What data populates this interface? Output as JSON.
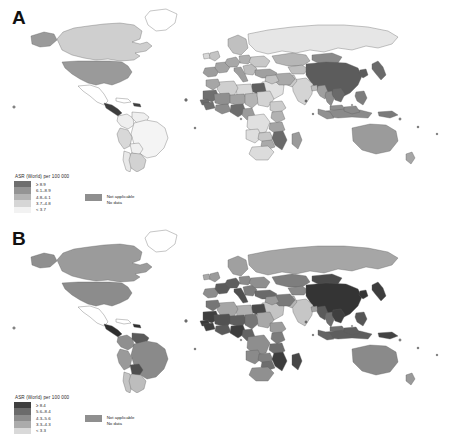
{
  "figure": {
    "type": "two-panel world choropleth map",
    "background": "#ffffff"
  },
  "panels": [
    {
      "letter": "A",
      "legend": {
        "title": "ASR (World) per 100 000",
        "classes": [
          {
            "label": "≥ 8.9",
            "color": "#6e6e6e"
          },
          {
            "label": "6.1–8.9",
            "color": "#949494"
          },
          {
            "label": "4.8–6.1",
            "color": "#b4b4b4"
          },
          {
            "label": "3.7–4.8",
            "color": "#d6d6d6"
          },
          {
            "label": "< 3.7",
            "color": "#f2f2f2"
          }
        ],
        "not_applicable": {
          "label": "Not applicable",
          "color": "#8f8f8f"
        },
        "no_data": {
          "label": "No data",
          "color": "#ffffff"
        }
      }
    },
    {
      "letter": "B",
      "legend": {
        "title": "ASR (World) per 100 000",
        "classes": [
          {
            "label": "≥ 8.4",
            "color": "#3f3f3f"
          },
          {
            "label": "5.6–8.4",
            "color": "#6b6b6b"
          },
          {
            "label": "4.3–5.6",
            "color": "#8d8d8d"
          },
          {
            "label": "3.3–4.3",
            "color": "#ababab"
          },
          {
            "label": "< 3.3",
            "color": "#d9d9d9"
          }
        ],
        "not_applicable": {
          "label": "Not applicable",
          "color": "#8f8f8f"
        },
        "no_data": {
          "label": "No data",
          "color": "#ffffff"
        }
      }
    }
  ],
  "chart_data": {
    "type": "heatmap",
    "title": "ASR (World) per 100 000",
    "subtitle": "",
    "xlabel": "",
    "ylabel": "",
    "legend_position": "bottom-left",
    "grid": false,
    "panels": [
      {
        "name": "A",
        "class_breaks": [
          "< 3.7",
          "3.7–4.8",
          "4.8–6.1",
          "6.1–8.9",
          "≥ 8.9"
        ],
        "regions": [
          {
            "name": "China",
            "class": 5
          },
          {
            "name": "Mongolia",
            "class": 5
          },
          {
            "name": "Japan",
            "class": 5
          },
          {
            "name": "North Korea",
            "class": 5
          },
          {
            "name": "South Korea",
            "class": 5
          },
          {
            "name": "Vietnam",
            "class": 5
          },
          {
            "name": "Laos",
            "class": 5
          },
          {
            "name": "Cambodia",
            "class": 5
          },
          {
            "name": "Thailand",
            "class": 4
          },
          {
            "name": "Myanmar",
            "class": 4
          },
          {
            "name": "Philippines",
            "class": 4
          },
          {
            "name": "Indonesia",
            "class": 4
          },
          {
            "name": "Malaysia",
            "class": 4
          },
          {
            "name": "Papua New Guinea",
            "class": 4
          },
          {
            "name": "India",
            "class": 3
          },
          {
            "name": "Pakistan",
            "class": 3
          },
          {
            "name": "Bangladesh",
            "class": 3
          },
          {
            "name": "Kazakhstan",
            "class": 4
          },
          {
            "name": "Russian Federation",
            "class": 2
          },
          {
            "name": "Iran",
            "class": 4
          },
          {
            "name": "Iraq",
            "class": 3
          },
          {
            "name": "Saudi Arabia",
            "class": 2
          },
          {
            "name": "Turkey",
            "class": 4
          },
          {
            "name": "Egypt",
            "class": 5
          },
          {
            "name": "Libya",
            "class": 3
          },
          {
            "name": "Algeria",
            "class": 3
          },
          {
            "name": "Morocco",
            "class": 4
          },
          {
            "name": "Mauritania",
            "class": 5
          },
          {
            "name": "Mali",
            "class": 4
          },
          {
            "name": "Niger",
            "class": 4
          },
          {
            "name": "Chad",
            "class": 4
          },
          {
            "name": "Sudan",
            "class": 3
          },
          {
            "name": "Nigeria",
            "class": 5
          },
          {
            "name": "Senegal",
            "class": 5
          },
          {
            "name": "Guinea",
            "class": 5
          },
          {
            "name": "Ghana",
            "class": 5
          },
          {
            "name": "Cameroon",
            "class": 4
          },
          {
            "name": "Ethiopia",
            "class": 3
          },
          {
            "name": "Kenya",
            "class": 4
          },
          {
            "name": "Tanzania",
            "class": 4
          },
          {
            "name": "Dem. Rep. Congo",
            "class": 3
          },
          {
            "name": "Angola",
            "class": 3
          },
          {
            "name": "Zambia",
            "class": 3
          },
          {
            "name": "Mozambique",
            "class": 5
          },
          {
            "name": "Zimbabwe",
            "class": 4
          },
          {
            "name": "South Africa",
            "class": 3
          },
          {
            "name": "Madagascar",
            "class": 4
          },
          {
            "name": "United States",
            "class": 4
          },
          {
            "name": "Canada",
            "class": 3
          },
          {
            "name": "Mexico",
            "class": 1
          },
          {
            "name": "Guatemala",
            "class": 5
          },
          {
            "name": "Brazil",
            "class": 2
          },
          {
            "name": "Argentina",
            "class": 2
          },
          {
            "name": "Peru",
            "class": 3
          },
          {
            "name": "Colombia",
            "class": 2
          },
          {
            "name": "Venezuela",
            "class": 2
          },
          {
            "name": "Chile",
            "class": 2
          },
          {
            "name": "Bolivia",
            "class": 2
          },
          {
            "name": "Australia",
            "class": 4
          },
          {
            "name": "New Zealand",
            "class": 4
          },
          {
            "name": "France",
            "class": 4
          },
          {
            "name": "Spain",
            "class": 4
          },
          {
            "name": "Germany",
            "class": 4
          },
          {
            "name": "Italy",
            "class": 4
          },
          {
            "name": "Poland",
            "class": 4
          },
          {
            "name": "Ukraine",
            "class": 3
          },
          {
            "name": "United Kingdom",
            "class": 3
          },
          {
            "name": "Scandinavia",
            "class": 3
          },
          {
            "name": "Greenland",
            "class": 0
          }
        ]
      },
      {
        "name": "B",
        "class_breaks": [
          "< 3.3",
          "3.3–4.3",
          "4.3–5.6",
          "5.6–8.4",
          "≥ 8.4"
        ],
        "regions": [
          {
            "name": "China",
            "class": 5
          },
          {
            "name": "Mongolia",
            "class": 5
          },
          {
            "name": "Japan",
            "class": 5
          },
          {
            "name": "North Korea",
            "class": 5
          },
          {
            "name": "South Korea",
            "class": 5
          },
          {
            "name": "Vietnam",
            "class": 5
          },
          {
            "name": "Laos",
            "class": 5
          },
          {
            "name": "Cambodia",
            "class": 5
          },
          {
            "name": "Thailand",
            "class": 4
          },
          {
            "name": "Myanmar",
            "class": 5
          },
          {
            "name": "Philippines",
            "class": 4
          },
          {
            "name": "Indonesia",
            "class": 4
          },
          {
            "name": "Malaysia",
            "class": 4
          },
          {
            "name": "Papua New Guinea",
            "class": 5
          },
          {
            "name": "India",
            "class": 2
          },
          {
            "name": "Pakistan",
            "class": 2
          },
          {
            "name": "Bangladesh",
            "class": 2
          },
          {
            "name": "Kazakhstan",
            "class": 4
          },
          {
            "name": "Russian Federation",
            "class": 3
          },
          {
            "name": "Iran",
            "class": 4
          },
          {
            "name": "Iraq",
            "class": 3
          },
          {
            "name": "Saudi Arabia",
            "class": 2
          },
          {
            "name": "Turkey",
            "class": 4
          },
          {
            "name": "Egypt",
            "class": 5
          },
          {
            "name": "Libya",
            "class": 3
          },
          {
            "name": "Algeria",
            "class": 3
          },
          {
            "name": "Morocco",
            "class": 4
          },
          {
            "name": "Mauritania",
            "class": 5
          },
          {
            "name": "Mali",
            "class": 5
          },
          {
            "name": "Niger",
            "class": 5
          },
          {
            "name": "Chad",
            "class": 4
          },
          {
            "name": "Sudan",
            "class": 3
          },
          {
            "name": "Nigeria",
            "class": 5
          },
          {
            "name": "Senegal",
            "class": 5
          },
          {
            "name": "Guinea",
            "class": 5
          },
          {
            "name": "Ghana",
            "class": 5
          },
          {
            "name": "Cameroon",
            "class": 5
          },
          {
            "name": "Ethiopia",
            "class": 3
          },
          {
            "name": "Kenya",
            "class": 4
          },
          {
            "name": "Tanzania",
            "class": 4
          },
          {
            "name": "Dem. Rep. Congo",
            "class": 4
          },
          {
            "name": "Angola",
            "class": 4
          },
          {
            "name": "Zambia",
            "class": 4
          },
          {
            "name": "Mozambique",
            "class": 5
          },
          {
            "name": "Zimbabwe",
            "class": 4
          },
          {
            "name": "South Africa",
            "class": 4
          },
          {
            "name": "Madagascar",
            "class": 5
          },
          {
            "name": "United States",
            "class": 4
          },
          {
            "name": "Canada",
            "class": 4
          },
          {
            "name": "Mexico",
            "class": 1
          },
          {
            "name": "Guatemala",
            "class": 5
          },
          {
            "name": "Brazil",
            "class": 4
          },
          {
            "name": "Argentina",
            "class": 3
          },
          {
            "name": "Peru",
            "class": 4
          },
          {
            "name": "Colombia",
            "class": 4
          },
          {
            "name": "Venezuela",
            "class": 5
          },
          {
            "name": "Chile",
            "class": 3
          },
          {
            "name": "Bolivia",
            "class": 5
          },
          {
            "name": "Australia",
            "class": 4
          },
          {
            "name": "New Zealand",
            "class": 4
          },
          {
            "name": "France",
            "class": 5
          },
          {
            "name": "Spain",
            "class": 4
          },
          {
            "name": "Germany",
            "class": 5
          },
          {
            "name": "Italy",
            "class": 5
          },
          {
            "name": "Poland",
            "class": 4
          },
          {
            "name": "Ukraine",
            "class": 4
          },
          {
            "name": "United Kingdom",
            "class": 4
          },
          {
            "name": "Scandinavia",
            "class": 4
          },
          {
            "name": "Greenland",
            "class": 0
          }
        ]
      }
    ]
  }
}
